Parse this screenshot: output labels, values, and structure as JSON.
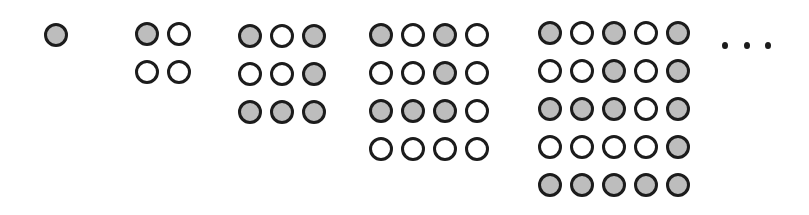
{
  "colors": {
    "filled": "#bdbdbd",
    "empty": "#ffffff",
    "outline": "#1c1c1c"
  },
  "grids": [
    {
      "size": 1,
      "origin": [
        44,
        23
      ],
      "pattern": [
        [
          1
        ]
      ]
    },
    {
      "size": 2,
      "origin": [
        135,
        22
      ],
      "pattern": [
        [
          1,
          0
        ],
        [
          0,
          0
        ]
      ]
    },
    {
      "size": 3,
      "origin": [
        238,
        24
      ],
      "pattern": [
        [
          1,
          0,
          1
        ],
        [
          0,
          0,
          1
        ],
        [
          1,
          1,
          1
        ]
      ]
    },
    {
      "size": 4,
      "origin": [
        369,
        23
      ],
      "pattern": [
        [
          1,
          0,
          1,
          0
        ],
        [
          0,
          0,
          1,
          0
        ],
        [
          1,
          1,
          1,
          0
        ],
        [
          0,
          0,
          0,
          0
        ]
      ]
    },
    {
      "size": 5,
      "origin": [
        538,
        21
      ],
      "pattern": [
        [
          1,
          0,
          1,
          0,
          1
        ],
        [
          0,
          0,
          1,
          0,
          1
        ],
        [
          1,
          1,
          1,
          0,
          1
        ],
        [
          0,
          0,
          0,
          0,
          1
        ],
        [
          1,
          1,
          1,
          1,
          1
        ]
      ]
    }
  ],
  "spacing": {
    "col": 32,
    "row": 38
  },
  "ellipsis": {
    "label": "...",
    "dots": [
      [
        722,
        42
      ],
      [
        744,
        42
      ],
      [
        765,
        42
      ]
    ]
  }
}
